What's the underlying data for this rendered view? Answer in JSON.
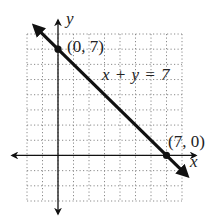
{
  "chart_data": {
    "type": "line",
    "title": "",
    "equation_label": "x + y = 7",
    "xlabel": "x",
    "ylabel": "y",
    "xlim": [
      -2,
      8
    ],
    "ylim": [
      -3,
      8
    ],
    "grid": true,
    "grid_style": "dotted",
    "series": [
      {
        "name": "x + y = 7",
        "x": [
          -1.5,
          8.3
        ],
        "y": [
          8.5,
          -1.3
        ],
        "arrows": "both"
      }
    ],
    "points": [
      {
        "x": 0,
        "y": 7,
        "label": "(0, 7)"
      },
      {
        "x": 7,
        "y": 0,
        "label": "(7, 0)"
      }
    ],
    "axes_arrows": true
  },
  "labels": {
    "y_axis": "y",
    "x_axis": "x",
    "equation_lhs": "x + y = 7",
    "point_a": "(0, 7)",
    "point_b": "(7, 0)"
  },
  "colors": {
    "ink": "#111111",
    "grid": "#8a8a8a",
    "background": "#ffffff"
  }
}
